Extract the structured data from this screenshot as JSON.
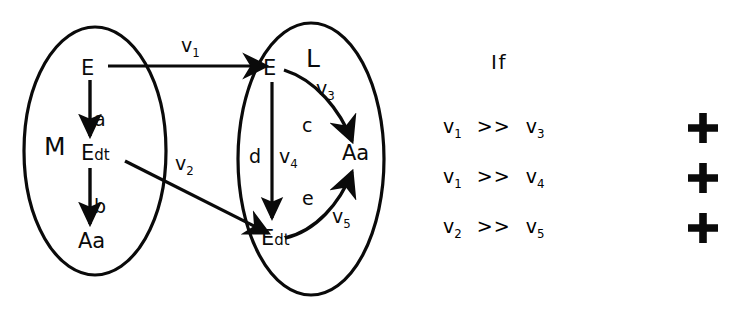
{
  "diagram": {
    "type": "category-mapping-diagram",
    "sets": [
      {
        "id": "M",
        "label": "M",
        "label_x": 50,
        "label_y": 148
      },
      {
        "id": "L",
        "label": "L",
        "label_x": 312,
        "label_y": 60
      }
    ],
    "nodes": [
      {
        "id": "m-e",
        "set": "M",
        "base": "E",
        "sub": "",
        "x": 88,
        "y": 70
      },
      {
        "id": "m-edt",
        "set": "M",
        "base": "E",
        "sub": "dt",
        "x": 88,
        "y": 155
      },
      {
        "id": "m-aa",
        "set": "M",
        "base": "Aa",
        "sub": "",
        "x": 85,
        "y": 243
      },
      {
        "id": "l-e",
        "set": "L",
        "base": "E",
        "sub": "",
        "x": 270,
        "y": 70
      },
      {
        "id": "l-edt",
        "set": "L",
        "base": "E",
        "sub": "dt",
        "x": 268,
        "y": 240
      },
      {
        "id": "l-aa",
        "set": "L",
        "base": "Aa",
        "sub": "",
        "x": 350,
        "y": 155
      }
    ],
    "edges": [
      {
        "id": "edge-a",
        "from": "m-e",
        "to": "m-edt",
        "label": "a",
        "label_x": 99,
        "label_y": 122,
        "vlabel": ""
      },
      {
        "id": "edge-b",
        "from": "m-edt",
        "to": "m-aa",
        "label": "b",
        "label_x": 99,
        "label_y": 209,
        "vlabel": ""
      },
      {
        "id": "edge-v1",
        "from": "m-e",
        "to": "l-e",
        "label": "",
        "vlabel": "v",
        "vsub": "1",
        "vlabel_x": 189,
        "vlabel_y": 47
      },
      {
        "id": "edge-v2",
        "from": "m-edt",
        "to": "l-edt",
        "label": "",
        "vlabel": "v",
        "vsub": "2",
        "vlabel_x": 182,
        "vlabel_y": 165
      },
      {
        "id": "edge-c",
        "from": "l-e",
        "to": "l-aa",
        "label": "c",
        "label_x": 307,
        "label_y": 127,
        "vlabel": "v",
        "vsub": "3",
        "vlabel_x": 322,
        "vlabel_y": 90
      },
      {
        "id": "edge-d",
        "from": "l-e",
        "to": "l-edt",
        "label": "d",
        "label_x": 255,
        "label_y": 158,
        "vlabel": "v",
        "vsub": "4",
        "vlabel_x": 285,
        "vlabel_y": 158
      },
      {
        "id": "edge-e",
        "from": "l-edt",
        "to": "l-aa",
        "label": "e",
        "label_x": 307,
        "label_y": 200,
        "vlabel": "v",
        "vsub": "5",
        "vlabel_x": 338,
        "vlabel_y": 218
      }
    ]
  },
  "conditions": {
    "heading": "If",
    "rows": [
      {
        "left": "v",
        "left_sub": "1",
        "op": ">>",
        "right": "v",
        "right_sub": "3",
        "mark": "plus"
      },
      {
        "left": "v",
        "left_sub": "1",
        "op": ">>",
        "right": "v",
        "right_sub": "4",
        "mark": "plus"
      },
      {
        "left": "v",
        "left_sub": "2",
        "op": ">>",
        "right": "v",
        "right_sub": "5",
        "mark": "plus"
      }
    ]
  },
  "style": {
    "ink": "#0a0a0a",
    "background": "#ffffff"
  }
}
